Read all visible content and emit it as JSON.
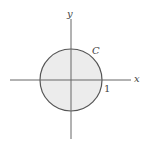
{
  "diagram": {
    "type": "coordinate-plane-with-circle",
    "axes": {
      "x_label": "x",
      "y_label": "y",
      "color": "#666666"
    },
    "circle": {
      "label": "C",
      "radius_label": "1",
      "fill": "#ececec",
      "stroke": "#555555"
    }
  }
}
